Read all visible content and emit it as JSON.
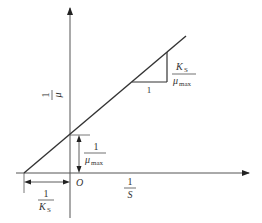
{
  "diagram": {
    "type": "Lineweaver-Burk style double-reciprocal plot",
    "y_axis_label": {
      "numerator": "1",
      "denominator": "μ"
    },
    "x_axis_label": {
      "numerator": "1",
      "denominator": "S"
    },
    "origin_label": "O",
    "y_intercept_label": {
      "numerator": "1",
      "denominator": "μ",
      "denominator_sub": "max"
    },
    "x_intercept_label": {
      "numerator": "1",
      "denominator": "K",
      "denominator_sub": "S"
    },
    "slope_label": {
      "numerator": "K",
      "numerator_sub": "S",
      "denominator": "μ",
      "denominator_sub": "max"
    },
    "slope_run_label": "1",
    "colors": {
      "line": "#333333",
      "axis": "#555555",
      "background": "#ffffff"
    }
  }
}
